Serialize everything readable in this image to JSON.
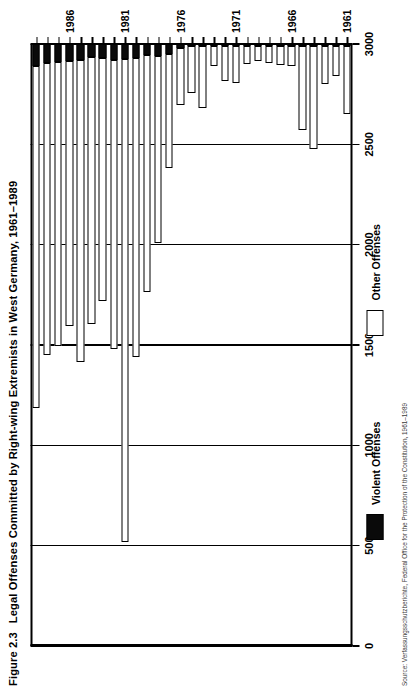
{
  "figure": {
    "number": "Figure 2.3",
    "title": "Legal Offenses Committed by Right-wing Extremists in West Germany, 1961–1989",
    "note": "Source: Verfassungsschutzberichte, Federal Office for the Protection of the Constitution, 1961–1989"
  },
  "legend": {
    "position": "bottom",
    "items": [
      {
        "label": "Violent Offenses",
        "color": "#0a0a0a"
      },
      {
        "label": "Other Offenses",
        "color": "#ffffff"
      }
    ]
  },
  "chart_data": {
    "type": "bar",
    "orientation": "horizontal",
    "stacked": true,
    "title": "Legal Offenses Committed by Right-wing Extremists in West Germany, 1961–1989",
    "xlabel": "",
    "ylabel": "",
    "xlim": [
      0,
      3000
    ],
    "xticks": [
      0,
      500,
      1000,
      1500,
      2000,
      2500,
      3000
    ],
    "xticklabels": [
      "0",
      "500",
      "1000",
      "1500",
      "2000",
      "2500",
      "3000"
    ],
    "grid": true,
    "categories": [
      "1961",
      "1962",
      "1963",
      "1964",
      "1965",
      "1966",
      "1967",
      "1968",
      "1969",
      "1970",
      "1971",
      "1972",
      "1973",
      "1974",
      "1975",
      "1976",
      "1977",
      "1978",
      "1979",
      "1980",
      "1981",
      "1982",
      "1983",
      "1984",
      "1985",
      "1986",
      "1987",
      "1988",
      "1989"
    ],
    "ytick_labels_shown": [
      "1961",
      "1966",
      "1971",
      "1976",
      "1981",
      "1986"
    ],
    "series": [
      {
        "name": "Violent Offenses",
        "color": "#0a0a0a",
        "values": [
          10,
          8,
          8,
          12,
          10,
          8,
          8,
          8,
          10,
          12,
          12,
          10,
          10,
          10,
          12,
          18,
          50,
          60,
          55,
          70,
          75,
          80,
          70,
          65,
          80,
          85,
          90,
          95,
          110
        ]
      },
      {
        "name": "Other Offenses",
        "color": "#ffffff",
        "values": [
          340,
          150,
          190,
          510,
          420,
          100,
          95,
          85,
          75,
          90,
          180,
          175,
          100,
          310,
          230,
          285,
          570,
          930,
          1180,
          1490,
          2405,
          1440,
          1210,
          1330,
          1505,
          1320,
          1415,
          1455,
          1705
        ]
      }
    ],
    "totals": [
      350,
      158,
      198,
      522,
      430,
      108,
      103,
      93,
      85,
      102,
      192,
      185,
      110,
      320,
      242,
      303,
      620,
      990,
      1235,
      1560,
      2480,
      1520,
      1280,
      1395,
      1585,
      1405,
      1505,
      1550,
      1815
    ]
  }
}
